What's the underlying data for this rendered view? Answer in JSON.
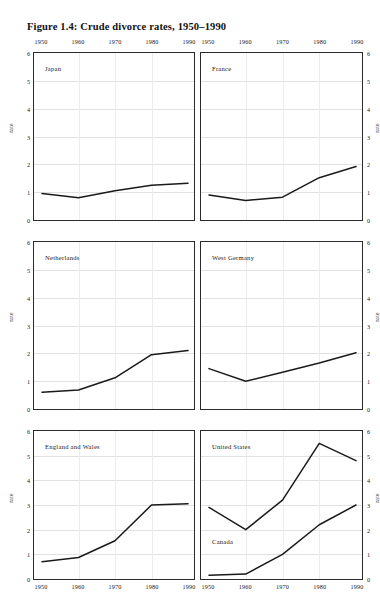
{
  "figure": {
    "title": "Figure 1.4: Crude divorce rates, 1950–1990",
    "axis_title": "rate",
    "line_color": "#1a1a1a",
    "border_color": "#2b2b2b",
    "grid_color": "#e2e2e2",
    "background": "#ffffff"
  },
  "axes": {
    "x_ticks": [
      "1950",
      "1960",
      "1970",
      "1980",
      "1990"
    ],
    "x_values": [
      1950,
      1960,
      1970,
      1980,
      1990
    ],
    "xlim": [
      1950,
      1990
    ],
    "y_ticks": [
      "0",
      "1",
      "2",
      "3",
      "4",
      "5",
      "6"
    ],
    "y_values": [
      0,
      1,
      2,
      3,
      4,
      5,
      6
    ],
    "ylim": [
      0,
      6
    ]
  },
  "chart_data": {
    "type": "line",
    "title": "Figure 1.4: Crude divorce rates, 1950–1990",
    "xlabel": "",
    "ylabel": "rate",
    "x": [
      1950,
      1960,
      1970,
      1980,
      1990
    ],
    "xlim": [
      1950,
      1990
    ],
    "ylim": [
      0,
      6
    ],
    "grid": true,
    "legend": "inline-panel-labels",
    "layout": {
      "rows": 3,
      "cols": 2
    },
    "panels": [
      {
        "id": "japan",
        "position": "top-left",
        "series": [
          {
            "name": "Japan",
            "values": [
              0.95,
              0.8,
              1.05,
              1.25,
              1.32
            ]
          }
        ]
      },
      {
        "id": "france",
        "position": "top-right",
        "series": [
          {
            "name": "France",
            "values": [
              0.9,
              0.7,
              0.82,
              1.52,
              1.92
            ]
          }
        ]
      },
      {
        "id": "netherlands",
        "position": "middle-left",
        "series": [
          {
            "name": "Netherlands",
            "values": [
              0.6,
              0.68,
              1.12,
              1.95,
              2.1
            ]
          }
        ]
      },
      {
        "id": "west-germany",
        "position": "middle-right",
        "series": [
          {
            "name": "West Germany",
            "values": [
              1.45,
              1.0,
              1.32,
              1.65,
              2.02
            ]
          }
        ]
      },
      {
        "id": "england-and-wales",
        "position": "bottom-left",
        "series": [
          {
            "name": "England and Wales",
            "values": [
              0.7,
              0.87,
              1.55,
              3.0,
              3.05
            ]
          }
        ]
      },
      {
        "id": "united-states-canada",
        "position": "bottom-right",
        "series": [
          {
            "name": "United States",
            "values": [
              2.9,
              2.0,
              3.2,
              5.5,
              4.8
            ]
          },
          {
            "name": "Canada",
            "values": [
              0.15,
              0.2,
              1.0,
              2.2,
              3.0
            ]
          }
        ]
      }
    ]
  }
}
